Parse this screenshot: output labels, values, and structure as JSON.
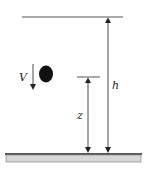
{
  "diagram": {
    "labels": {
      "velocity": "V",
      "height_total": "h",
      "height_current": "z"
    },
    "colors": {
      "line": "#333333",
      "ball": "#111111",
      "ground_top": "#555555",
      "ground_fill": "#d8d8d8",
      "ground_border": "#888888"
    },
    "elements": [
      {
        "type": "reference-line",
        "name": "top-height-line"
      },
      {
        "type": "reference-line",
        "name": "z-height-line"
      },
      {
        "type": "dimension-arrow",
        "name": "h-arrow",
        "label": "h"
      },
      {
        "type": "dimension-arrow",
        "name": "z-arrow",
        "label": "z"
      },
      {
        "type": "object",
        "name": "falling-ball"
      },
      {
        "type": "velocity-arrow",
        "name": "velocity-arrow",
        "label": "V",
        "direction": "down"
      },
      {
        "type": "surface",
        "name": "ground"
      }
    ]
  }
}
